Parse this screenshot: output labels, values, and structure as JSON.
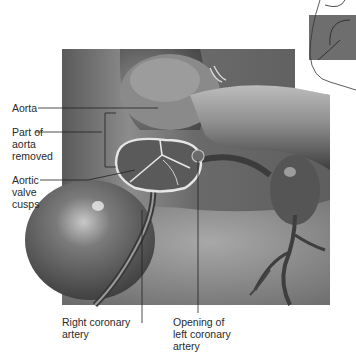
{
  "figure": {
    "labels": {
      "aorta": "Aorta",
      "part_removed": "Part of\naorta\nremoved",
      "aortic_cusps": "Aortic\nvalve\ncusps",
      "right_coronary": "Right coronary\nartery",
      "left_coronary_opening": "Opening of\nleft coronary\nartery"
    },
    "inset": {
      "description": "Heart outline with highlighted region"
    },
    "colors": {
      "tissue_dark": "#4a4a4a",
      "tissue_mid": "#7a7a7a",
      "tissue_light": "#bdbdbd",
      "leader_line": "#222222",
      "inset_fill": "#6e6e6e"
    }
  }
}
